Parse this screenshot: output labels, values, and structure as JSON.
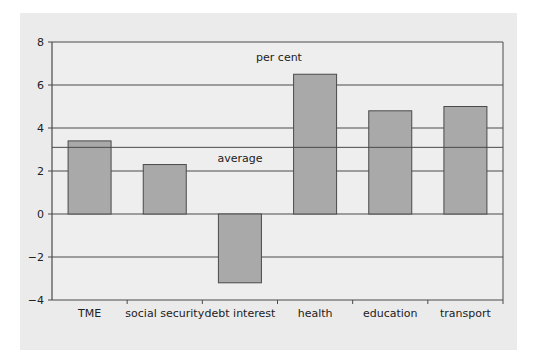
{
  "chart_data": {
    "type": "bar",
    "title": "",
    "xlabel": "",
    "ylabel": "per cent",
    "categories": [
      "TME",
      "social security",
      "debt interest",
      "health",
      "education",
      "transport"
    ],
    "values": [
      3.4,
      2.3,
      -3.2,
      6.5,
      4.8,
      5.0
    ],
    "ylim": [
      -4,
      8
    ],
    "yticks": [
      -4,
      -2,
      0,
      2,
      4,
      6,
      8
    ],
    "ytick_labels": [
      "−4",
      "−2",
      "0",
      "2",
      "4",
      "6",
      "8"
    ],
    "grid": true,
    "annotations": [
      {
        "text": "per cent",
        "y": 7.3
      },
      {
        "text": "average",
        "y": 2.6
      }
    ],
    "reference_lines": [
      {
        "name": "average",
        "value": 3.1
      }
    ],
    "colors": {
      "bar_fill": "#a9a9a9",
      "bar_stroke": "#4a4a4a",
      "grid": "#4a4a4a",
      "panel_bg": "#ebebeb",
      "plot_bg": "#eeeeee"
    }
  }
}
